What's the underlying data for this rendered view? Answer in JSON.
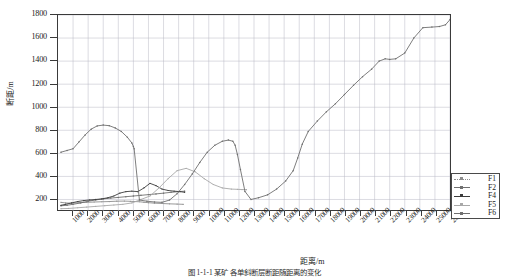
{
  "chart_data": {
    "type": "line",
    "title": "",
    "xlabel": "距离/m",
    "ylabel": "断距/m",
    "xlim": [
      0,
      26000
    ],
    "ylim": [
      100,
      1800
    ],
    "grid": true,
    "legend_position": "bottom-right",
    "xticks": [
      1000,
      2000,
      3000,
      4000,
      5000,
      6000,
      7000,
      8000,
      9000,
      10000,
      11000,
      12000,
      13000,
      14000,
      15000,
      16000,
      17000,
      18000,
      19000,
      20000,
      21000,
      22000,
      23000,
      24000,
      25000,
      26000
    ],
    "xtick_labels": [
      "1000",
      "2000",
      "3000",
      "4000",
      "5000",
      "6000",
      "7000",
      "8000",
      "9000",
      "10000",
      "11000",
      "12000",
      "13000",
      "14000",
      "15000",
      "16000",
      "17000",
      "18000",
      "19000",
      "20000",
      "21000",
      "22000",
      "23000",
      "24000",
      "25000",
      "26000"
    ],
    "yticks": [
      200,
      400,
      600,
      800,
      1000,
      1200,
      1400,
      1600,
      1800
    ],
    "ytick_labels": [
      "200",
      "400",
      "600",
      "800",
      "1000",
      "1200",
      "1400",
      "1600",
      "1800"
    ],
    "series": [
      {
        "name": "F1",
        "color": "#8d8d8d",
        "marker": "dot",
        "x": [
          200,
          500,
          900,
          1400,
          1900,
          2400,
          2900,
          3400,
          3900,
          4400,
          4800,
          5100,
          5400,
          5700,
          6000,
          6400,
          6900,
          7400,
          7900,
          8300
        ],
        "y": [
          175,
          170,
          168,
          172,
          175,
          178,
          180,
          182,
          185,
          186,
          184,
          182,
          180,
          176,
          172,
          168,
          165,
          162,
          160,
          158
        ]
      },
      {
        "name": "F2",
        "color": "#707070",
        "marker": "plus",
        "x": [
          200,
          600,
          1000,
          1500,
          2000,
          2500,
          3000,
          3500,
          4000,
          4500,
          5000,
          5500,
          6000,
          6500,
          7000,
          7500,
          8000,
          8400
        ],
        "y": [
          145,
          150,
          158,
          170,
          185,
          196,
          205,
          212,
          218,
          224,
          230,
          236,
          242,
          248,
          255,
          262,
          268,
          272
        ]
      },
      {
        "name": "F4",
        "color": "#3c3c3c",
        "marker": "dot",
        "x": [
          200,
          500,
          900,
          1300,
          1700,
          2100,
          2500,
          2900,
          3300,
          3700,
          4100,
          4500,
          4900,
          5300,
          5700,
          6100,
          6500,
          6900,
          7300,
          7700,
          8100,
          8400
        ],
        "y": [
          150,
          158,
          170,
          182,
          190,
          196,
          200,
          205,
          215,
          230,
          255,
          268,
          272,
          268,
          300,
          340,
          320,
          290,
          278,
          272,
          268,
          262
        ]
      },
      {
        "name": "F5",
        "color": "#a8a8a8",
        "marker": "dot",
        "x": [
          200,
          700,
          1300,
          1900,
          2500,
          3100,
          3700,
          4300,
          4900,
          5500,
          6100,
          6700,
          7300,
          7900,
          8500,
          9100,
          9700,
          10300,
          10900,
          11500,
          11900,
          12200,
          12500
        ],
        "y": [
          120,
          122,
          128,
          134,
          140,
          146,
          152,
          158,
          170,
          200,
          230,
          300,
          380,
          450,
          470,
          440,
          380,
          330,
          300,
          290,
          288,
          286,
          285
        ]
      },
      {
        "name": "F6",
        "color": "#6f6f6f",
        "marker": "plus",
        "x": [
          200,
          600,
          1000,
          1400,
          1800,
          2200,
          2600,
          3000,
          3400,
          3800,
          4200,
          4600,
          4900,
          5000,
          5050,
          5400,
          5900,
          6400,
          6900,
          7400,
          7900,
          8400,
          8900,
          9400,
          9900,
          10400,
          10900,
          11300,
          11600,
          11750,
          11900,
          12100,
          12400,
          12800,
          13300,
          13900,
          14500,
          15100,
          15600,
          15900,
          16200,
          16600,
          17200,
          17800,
          18400,
          19000,
          19600,
          20200,
          20800,
          21300,
          21700,
          22000,
          22400,
          23000,
          23600,
          24200,
          24800,
          25300,
          25700,
          26000
        ],
        "y": [
          610,
          625,
          640,
          700,
          760,
          810,
          838,
          845,
          840,
          820,
          790,
          740,
          690,
          660,
          640,
          195,
          185,
          178,
          175,
          195,
          250,
          330,
          420,
          520,
          610,
          670,
          705,
          715,
          705,
          670,
          590,
          460,
          270,
          200,
          215,
          240,
          290,
          360,
          450,
          560,
          680,
          790,
          880,
          960,
          1030,
          1110,
          1190,
          1265,
          1330,
          1400,
          1420,
          1415,
          1420,
          1470,
          1600,
          1690,
          1695,
          1700,
          1715,
          1760
        ]
      }
    ]
  },
  "legend": {
    "items": [
      {
        "label": "F1"
      },
      {
        "label": "F2"
      },
      {
        "label": "F4"
      },
      {
        "label": "F5"
      },
      {
        "label": "F6"
      }
    ]
  },
  "caption": "图 1-1-1  某矿 各单斜断层断距随距离的变化"
}
